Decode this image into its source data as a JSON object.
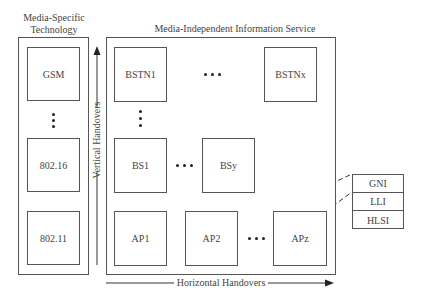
{
  "diagram": {
    "left_panel": {
      "title_line1": "Media-Specific",
      "title_line2": "Technology",
      "items": [
        "GSM",
        "802.16",
        "802.11"
      ]
    },
    "main_panel": {
      "title": "Media-Independent Information Service",
      "rows": {
        "bstn": [
          "BSTN1",
          "BSTNx"
        ],
        "bs": [
          "BS1",
          "BSy"
        ],
        "ap": [
          "AP1",
          "AP2",
          "APz"
        ]
      }
    },
    "vertical_axis_label": "Vertical Handovers",
    "horizontal_axis_label": "Horizontal Handovers",
    "info_table": {
      "rows": [
        "GNI",
        "LLI",
        "HLSI"
      ]
    }
  }
}
